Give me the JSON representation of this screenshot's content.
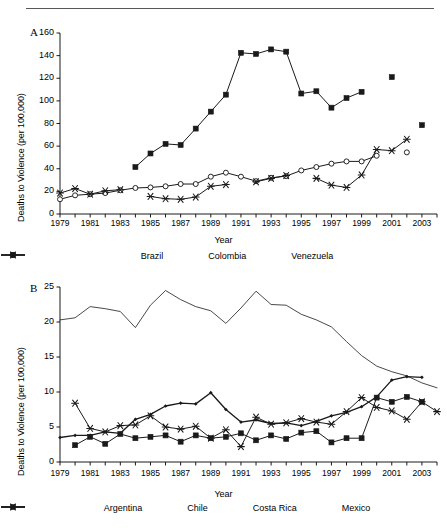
{
  "figure": {
    "panel_a_letter": "A",
    "panel_b_letter": "B"
  },
  "chart_data": [
    {
      "type": "line",
      "panel": "A",
      "title": "",
      "xlabel": "Year",
      "ylabel": "Deaths to Violence (per 100,000)",
      "ylim": [
        0,
        160
      ],
      "yticks": [
        0,
        20,
        40,
        60,
        80,
        100,
        120,
        140,
        160
      ],
      "xlim": [
        1979,
        2004
      ],
      "xticks": [
        1979,
        1981,
        1983,
        1985,
        1987,
        1989,
        1991,
        1993,
        1995,
        1997,
        1999,
        2001,
        2003
      ],
      "x": [
        1979,
        1980,
        1981,
        1982,
        1983,
        1984,
        1985,
        1986,
        1987,
        1988,
        1989,
        1990,
        1991,
        1992,
        1993,
        1994,
        1995,
        1996,
        1997,
        1998,
        1999,
        2000,
        2001,
        2002,
        2003,
        2004
      ],
      "grid": false,
      "legend_position": "bottom",
      "series": [
        {
          "name": "Brazil",
          "marker": "circle",
          "values": [
            13.0,
            16.5,
            17.5,
            18.5,
            21.0,
            23.0,
            23.5,
            24.5,
            26.5,
            26.5,
            33.0,
            36.5,
            33.0,
            29.0,
            32.0,
            33.5,
            38.5,
            41.5,
            44.5,
            46.5,
            46.5,
            51.5,
            null,
            54.5,
            null,
            null
          ]
        },
        {
          "name": "Colombia",
          "marker": "square",
          "values": [
            null,
            null,
            null,
            null,
            null,
            41.5,
            53.5,
            62.0,
            61.0,
            75.5,
            90.5,
            105.5,
            142.5,
            141.5,
            145.5,
            143.5,
            106.5,
            108.5,
            94.0,
            102.5,
            108.0,
            null,
            121.0,
            null,
            78.5,
            null
          ]
        },
        {
          "name": "Venezuela",
          "marker": "asterisk",
          "values": [
            18.5,
            22.5,
            17.5,
            20.5,
            21.5,
            null,
            15.5,
            13.5,
            13.0,
            15.0,
            24.5,
            26.0,
            null,
            28.5,
            31.5,
            34.0,
            null,
            31.5,
            25.5,
            23.5,
            34.5,
            57.0,
            56.0,
            66.0,
            null,
            null
          ]
        }
      ]
    },
    {
      "type": "line",
      "panel": "B",
      "title": "",
      "xlabel": "Year",
      "ylabel": "Deaths to Violence (per 100,000)",
      "ylim": [
        0,
        25
      ],
      "yticks": [
        0,
        5,
        10,
        15,
        20,
        25
      ],
      "xlim": [
        1979,
        2004
      ],
      "xticks": [
        1979,
        1981,
        1983,
        1985,
        1987,
        1989,
        1991,
        1993,
        1995,
        1997,
        1999,
        2001,
        2003
      ],
      "x": [
        1979,
        1980,
        1981,
        1982,
        1983,
        1984,
        1985,
        1986,
        1987,
        1988,
        1989,
        1990,
        1991,
        1992,
        1993,
        1994,
        1995,
        1996,
        1997,
        1998,
        1999,
        2000,
        2001,
        2002,
        2003,
        2004
      ],
      "grid": false,
      "legend_position": "bottom",
      "series": [
        {
          "name": "Argentina",
          "marker": "dot",
          "values": [
            3.5,
            3.8,
            3.8,
            4.3,
            4.1,
            6.1,
            6.8,
            8.0,
            8.4,
            8.3,
            9.9,
            7.5,
            5.7,
            6.0,
            5.5,
            5.6,
            5.2,
            5.8,
            6.6,
            7.1,
            7.9,
            9.3,
            11.7,
            12.2,
            12.1,
            null
          ]
        },
        {
          "name": "Chile",
          "marker": "square",
          "values": [
            null,
            2.4,
            3.6,
            2.6,
            4.0,
            3.4,
            3.6,
            3.8,
            2.9,
            3.8,
            3.4,
            3.6,
            4.1,
            3.1,
            3.8,
            3.3,
            4.2,
            4.4,
            2.8,
            3.4,
            3.4,
            9.2,
            8.6,
            9.3,
            8.6,
            null
          ]
        },
        {
          "name": "Costa Rica",
          "marker": "asterisk",
          "values": [
            null,
            8.4,
            4.8,
            4.3,
            5.2,
            5.3,
            6.6,
            5.0,
            4.7,
            5.1,
            3.4,
            4.6,
            2.2,
            6.4,
            5.4,
            5.6,
            6.2,
            5.7,
            5.4,
            7.2,
            9.2,
            7.8,
            7.3,
            6.1,
            8.6,
            7.2
          ]
        },
        {
          "name": "Mexico",
          "marker": "none",
          "values": [
            20.3,
            20.6,
            22.2,
            21.9,
            21.5,
            19.2,
            22.4,
            24.5,
            23.2,
            22.2,
            21.6,
            19.8,
            22.0,
            24.4,
            22.5,
            22.4,
            21.1,
            20.3,
            19.3,
            17.2,
            15.2,
            13.7,
            12.9,
            12.3,
            11.3,
            10.6
          ]
        }
      ]
    }
  ],
  "panel_a": {
    "letter": "A",
    "y_axis_label": "Deaths to Violence (per 100,000)",
    "x_axis_label": "Year",
    "y_ticks": [
      "0",
      "20",
      "40",
      "60",
      "80",
      "100",
      "120",
      "140",
      "160"
    ],
    "x_ticks": [
      "1979",
      "1981",
      "1983",
      "1985",
      "1987",
      "1989",
      "1991",
      "1993",
      "1995",
      "1997",
      "1999",
      "2001",
      "2003"
    ],
    "legend": [
      {
        "label": "Brazil",
        "marker": "circle"
      },
      {
        "label": "Colombia",
        "marker": "square"
      },
      {
        "label": "Venezuela",
        "marker": "asterisk"
      }
    ]
  },
  "panel_b": {
    "letter": "B",
    "y_axis_label": "Deaths to Violence (per 100,000)",
    "x_axis_label": "Year",
    "y_ticks": [
      "0",
      "5",
      "10",
      "15",
      "20",
      "25"
    ],
    "x_ticks": [
      "1979",
      "1981",
      "1983",
      "1985",
      "1987",
      "1989",
      "1991",
      "1993",
      "1995",
      "1997",
      "1999",
      "2001",
      "2003"
    ],
    "legend": [
      {
        "label": "Argentina",
        "marker": "dot"
      },
      {
        "label": "Chile",
        "marker": "square"
      },
      {
        "label": "Costa Rica",
        "marker": "asterisk"
      },
      {
        "label": "Mexico",
        "marker": "none"
      }
    ]
  }
}
